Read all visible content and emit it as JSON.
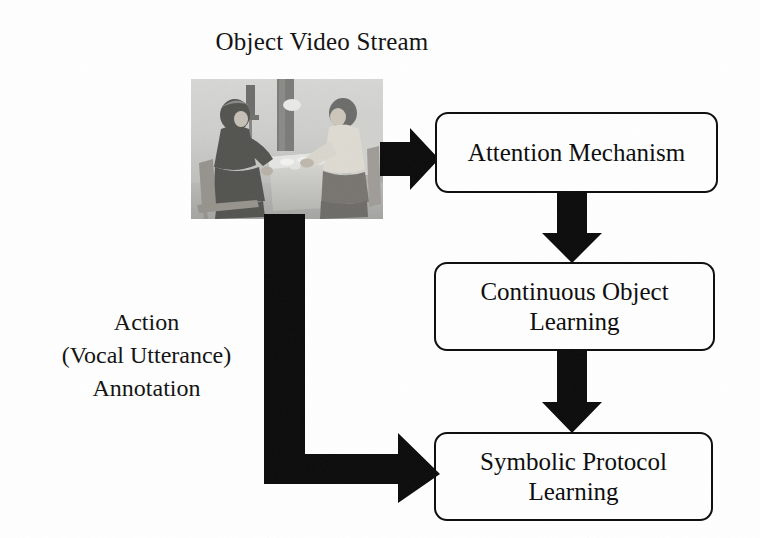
{
  "figure": {
    "title": "Object Video Stream",
    "background_color": "#ffffff",
    "ink_color": "#0d0d0d"
  },
  "photo": {
    "caption": "grayscale photograph of two people seated at a table with small objects",
    "alt": "experiment-scene-photo"
  },
  "nodes": [
    {
      "id": "attention",
      "lines": [
        "Attention Mechanism"
      ],
      "line1": "Attention Mechanism",
      "line2": ""
    },
    {
      "id": "continuous",
      "lines": [
        "Continuous Object",
        "Learning"
      ],
      "line1": "Continuous Object",
      "line2": "Learning"
    },
    {
      "id": "symbolic",
      "lines": [
        "Symbolic Protocol",
        "Learning"
      ],
      "line1": "Symbolic Protocol",
      "line2": "Learning"
    }
  ],
  "annotation": {
    "line1": "Action",
    "line2": "(Vocal Utterance)",
    "line3": "Annotation"
  },
  "arrows": [
    {
      "id": "photo-to-attention",
      "from": "photo",
      "to": "attention",
      "direction": "right"
    },
    {
      "id": "attention-to-continuous",
      "from": "attention",
      "to": "continuous",
      "direction": "down"
    },
    {
      "id": "continuous-to-symbolic",
      "from": "continuous",
      "to": "symbolic",
      "direction": "down"
    },
    {
      "id": "annotation-elbow",
      "from": "photo",
      "to": "symbolic",
      "direction": "down-then-right"
    }
  ]
}
